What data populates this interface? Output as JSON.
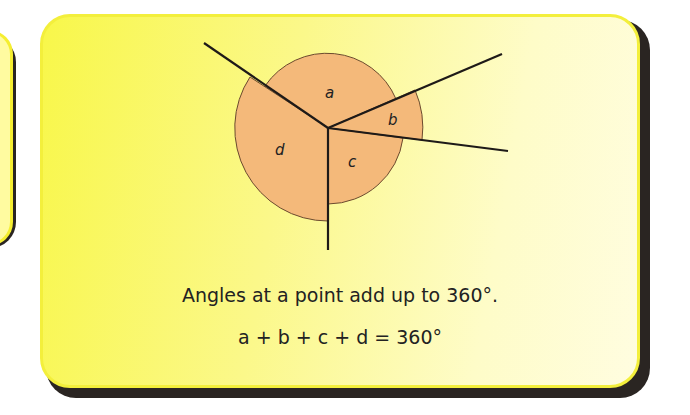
{
  "diagram": {
    "title": "Angles at a point",
    "center": {
      "x": 328,
      "y": 128
    },
    "angle_labels": {
      "a": "a",
      "b": "b",
      "c": "c",
      "d": "d"
    },
    "colors": {
      "sector_fill": "#f4b97a",
      "line": "#1e1a18",
      "panel_yellow": "#f8f74a",
      "panel_pale": "#fffde0",
      "shadow": "#2a2522"
    }
  },
  "caption": {
    "statement": "Angles at a point add up to 360°.",
    "equation": "a + b + c + d = 360°"
  }
}
